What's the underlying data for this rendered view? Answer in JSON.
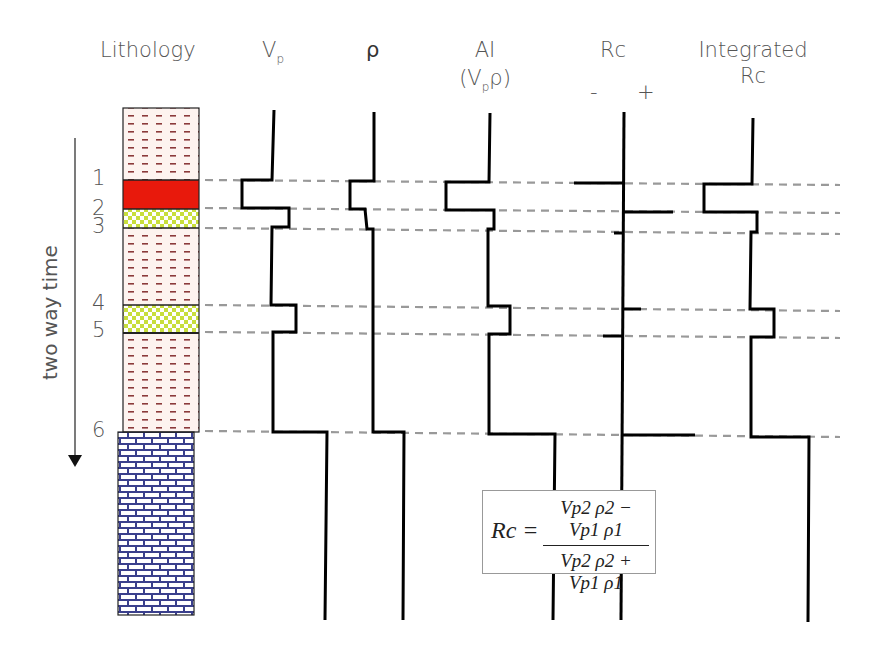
{
  "headers": {
    "lithology": "Lithology",
    "vp": "V",
    "vp_sub": "p",
    "rho": "ρ",
    "ai": "AI",
    "ai_formula_open": "(V",
    "ai_formula_sub": "p",
    "ai_formula_close": "ρ)",
    "rc": "Rc",
    "rc_minus": "-",
    "rc_plus": "+",
    "integrated_line1": "Integrated",
    "integrated_line2": "Rc"
  },
  "axis": {
    "label": "two way time",
    "direction": "down"
  },
  "boundaries": [
    {
      "label": "1",
      "y": 180
    },
    {
      "label": "2",
      "y": 209
    },
    {
      "label": "3",
      "y": 228
    },
    {
      "label": "4",
      "y": 305
    },
    {
      "label": "5",
      "y": 333
    },
    {
      "label": "6",
      "y": 432
    }
  ],
  "lithology_layers": [
    {
      "name": "shale",
      "pattern": "dashes",
      "color": "#8b3a3a",
      "top": 108,
      "bottom": 180
    },
    {
      "name": "red-layer",
      "pattern": "solid",
      "color": "#e8190c",
      "top": 180,
      "bottom": 209
    },
    {
      "name": "sand",
      "pattern": "checker",
      "color": "#c8de3c",
      "top": 209,
      "bottom": 228
    },
    {
      "name": "shale",
      "pattern": "dashes",
      "color": "#8b3a3a",
      "top": 228,
      "bottom": 305
    },
    {
      "name": "sand",
      "pattern": "checker",
      "color": "#c8de3c",
      "top": 305,
      "bottom": 333
    },
    {
      "name": "shale",
      "pattern": "dashes",
      "color": "#8b3a3a",
      "top": 333,
      "bottom": 432
    },
    {
      "name": "limestone",
      "pattern": "brick",
      "color": "#3a3f8c",
      "top": 432,
      "bottom": 615
    }
  ],
  "formula": {
    "lhs": "Rc =",
    "numerator": "Vp2 ρ2 − Vp1 ρ1",
    "denominator": "Vp2 ρ2 + Vp1 ρ1"
  },
  "colors": {
    "guide_dash": "#999999",
    "trace": "#000000",
    "text": "#555555"
  }
}
